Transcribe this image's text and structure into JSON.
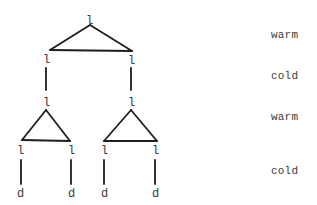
{
  "diagram": {
    "type": "tree",
    "nodes": {
      "root": "l",
      "l1_left": "l",
      "l1_right": "l",
      "l2_left": "l",
      "l2_right": "l",
      "l3_ll": "l",
      "l3_lr": "l",
      "l3_rl": "l",
      "l3_rr": "l",
      "leaf_ll": "d",
      "leaf_lr": "d",
      "leaf_rl": "d",
      "leaf_rr": "d"
    },
    "edges": [
      {
        "from": "root",
        "to": "l1_left",
        "style": "triangle"
      },
      {
        "from": "root",
        "to": "l1_right",
        "style": "triangle"
      },
      {
        "from": "l1_left",
        "to": "l2_left",
        "style": "vertical"
      },
      {
        "from": "l1_right",
        "to": "l2_right",
        "style": "vertical"
      },
      {
        "from": "l2_left",
        "to": "l3_ll",
        "style": "triangle"
      },
      {
        "from": "l2_left",
        "to": "l3_lr",
        "style": "triangle"
      },
      {
        "from": "l2_right",
        "to": "l3_rl",
        "style": "triangle"
      },
      {
        "from": "l2_right",
        "to": "l3_rr",
        "style": "triangle"
      },
      {
        "from": "l3_ll",
        "to": "leaf_ll",
        "style": "vertical"
      },
      {
        "from": "l3_lr",
        "to": "leaf_lr",
        "style": "vertical"
      },
      {
        "from": "l3_rl",
        "to": "leaf_rl",
        "style": "vertical"
      },
      {
        "from": "l3_rr",
        "to": "leaf_rr",
        "style": "vertical"
      }
    ],
    "level_labels": [
      "warm",
      "cold",
      "warm",
      "cold"
    ]
  }
}
